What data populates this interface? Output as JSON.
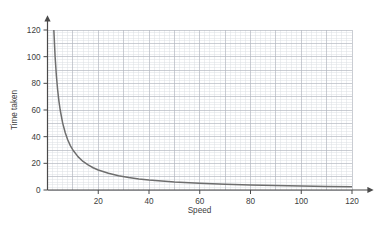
{
  "chart_data": {
    "type": "line",
    "title": "",
    "subtitle": "",
    "xlabel": "Speed",
    "ylabel": "Time taken",
    "xlim": [
      0,
      120
    ],
    "ylim": [
      0,
      120
    ],
    "xticks": [
      20,
      40,
      60,
      80,
      100,
      120
    ],
    "yticks": [
      0,
      20,
      40,
      60,
      80,
      100,
      120
    ],
    "xtick_labels": [
      "20",
      "40",
      "60",
      "80",
      "100",
      "120"
    ],
    "ytick_labels": [
      "0",
      "20",
      "40",
      "60",
      "80",
      "100",
      "120"
    ],
    "grid": true,
    "grid_minor_step": 2,
    "grid_major_step": 10,
    "legend": null,
    "legend_position": "none",
    "annotations": [],
    "relationship": "inverse proportion",
    "equation": "y = 300 / x",
    "constant_k": 300,
    "series": [
      {
        "name": "Time taken vs Speed",
        "color": "#6e6e6e",
        "x": [
          2.5,
          3,
          3.5,
          4,
          4.5,
          5,
          6,
          7,
          8,
          9,
          10,
          12,
          14,
          16,
          18,
          20,
          24,
          28,
          32,
          36,
          40,
          50,
          60,
          70,
          80,
          90,
          100,
          110,
          120
        ],
        "values": [
          120,
          100,
          85.7,
          75,
          66.7,
          60,
          50,
          42.9,
          37.5,
          33.3,
          30,
          25,
          21.4,
          18.8,
          16.7,
          15,
          12.5,
          10.7,
          9.4,
          8.3,
          7.5,
          6,
          5,
          4.3,
          3.8,
          3.3,
          3,
          2.7,
          2.5
        ]
      }
    ]
  },
  "axes": {
    "x_axis_name": "Speed",
    "y_axis_name": "Time taken",
    "x_arrow": true,
    "y_arrow": true
  },
  "colors": {
    "curve": "#6e6e6e",
    "axis": "#5a5a5a",
    "grid_major": "#b8bcc4",
    "grid_minor": "#dcdfe4",
    "text": "#404040",
    "background": "#ffffff"
  }
}
